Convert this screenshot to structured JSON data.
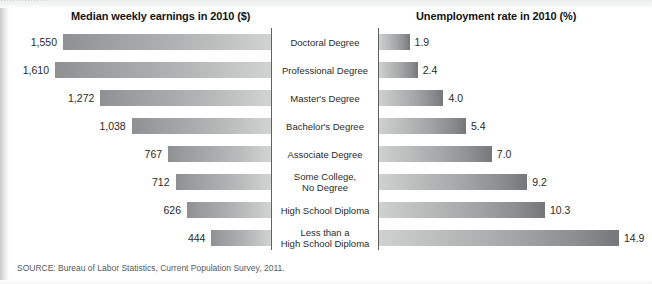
{
  "top_bleed_text": "················",
  "headers": {
    "left": "Median weekly earnings in 2010 ($)",
    "right": "Unemployment rate in 2010 (%)"
  },
  "source": "SOURCE: Bureau of Labor Statistics, Current Population Survey, 2011.",
  "colors": {
    "bar_dark": "#8e9091",
    "bar_light": "#d2d3d3",
    "axis": "#5f6263",
    "text": "#2a2a2a",
    "header_text": "#141414",
    "source_text": "#58595b",
    "background": "#ffffff"
  },
  "chart_data": {
    "type": "bar",
    "title": "",
    "orientation": "horizontal",
    "layout": "back-to-back paired bar chart (butterfly / tornado) with centered category labels",
    "categories": [
      "Doctoral Degree",
      "Professional Degree",
      "Master's Degree",
      "Bachelor's Degree",
      "Associate Degree",
      "Some College,\nNo Degree",
      "High School Diploma",
      "Less than a\nHigh School Diploma"
    ],
    "series": [
      {
        "name": "Median weekly earnings in 2010 ($)",
        "side": "left",
        "direction": "right-to-left (bars anchored at centre axis, extending leftward)",
        "unit": "$",
        "values": [
          1550,
          1610,
          1272,
          1038,
          767,
          712,
          626,
          444
        ],
        "labels": [
          "1,550",
          "1,610",
          "1,272",
          "1,038",
          "767",
          "712",
          "626",
          "444"
        ],
        "max": 1610,
        "xlim": [
          0,
          1610
        ]
      },
      {
        "name": "Unemployment rate in 2010 (%)",
        "side": "right",
        "direction": "left-to-right (bars anchored at centre axis, extending rightward)",
        "unit": "%",
        "values": [
          1.9,
          2.4,
          4.0,
          5.4,
          7.0,
          9.2,
          10.3,
          14.9
        ],
        "labels": [
          "1.9",
          "2.4",
          "4.0",
          "5.4",
          "7.0",
          "9.2",
          "10.3",
          "14.9"
        ],
        "max": 14.9,
        "xlim": [
          0,
          14.9
        ]
      }
    ],
    "xlabel": "",
    "ylabel": "",
    "grid": false,
    "legend": "none",
    "annotations": [
      "SOURCE: Bureau of Labor Statistics, Current Population Survey, 2011."
    ]
  },
  "geometry": {
    "left_axis_x": 271,
    "right_axis_x": 378,
    "left_bar_max_px": 216,
    "right_bar_max_px": 240,
    "row_height": 28,
    "bar_height": 16,
    "rows_top": 28
  }
}
